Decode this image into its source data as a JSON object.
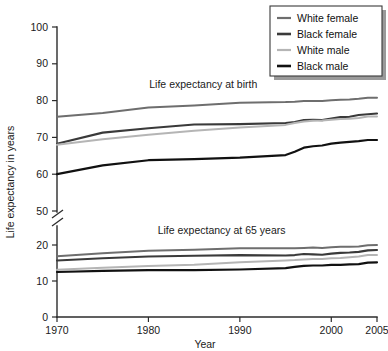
{
  "chart_data": {
    "type": "line",
    "title": "",
    "xlabel": "Year",
    "ylabel": "Life expectancy in years",
    "xlim": [
      1970,
      2005
    ],
    "ylim": [
      0,
      100
    ],
    "grid": false,
    "axis_break": {
      "present": true,
      "between": [
        20,
        50
      ],
      "note": "y-axis broken between 20 and 50"
    },
    "legend_position": "top-right",
    "x_ticks": [
      1970,
      1980,
      1990,
      2000,
      2005
    ],
    "x_tick_labels": [
      "1970",
      "1980",
      "1990",
      "2000",
      "2005"
    ],
    "y_ticks": [
      0,
      10,
      20,
      50,
      60,
      70,
      80,
      90,
      100
    ],
    "y_tick_labels": [
      "0",
      "10",
      "20",
      "50",
      "60",
      "70",
      "80",
      "90",
      "100"
    ],
    "annotations": [
      {
        "text": "Life expectancy at birth",
        "x": 1986,
        "y": 83.5
      },
      {
        "text": "Life expectancy at 65 years",
        "x": 1988,
        "y": 23.0
      }
    ],
    "legend_entries": [
      {
        "label": "White female",
        "color": "#6e6e6e"
      },
      {
        "label": "Black female",
        "color": "#3a3a3a"
      },
      {
        "label": "White male",
        "color": "#b5b5b5"
      },
      {
        "label": "Black male",
        "color": "#111111"
      }
    ],
    "x": [
      1970,
      1975,
      1980,
      1985,
      1990,
      1995,
      1996,
      1997,
      1998,
      1999,
      2000,
      2001,
      2002,
      2003,
      2004,
      2005
    ],
    "groups": [
      {
        "name": "Life expectancy at birth",
        "series": [
          {
            "name": "White female",
            "color": "#6e6e6e",
            "width": 2.0,
            "values": [
              75.6,
              76.6,
              78.1,
              78.7,
              79.4,
              79.6,
              79.7,
              79.9,
              79.9,
              79.9,
              80.1,
              80.2,
              80.3,
              80.5,
              80.8,
              80.8
            ]
          },
          {
            "name": "Black female",
            "color": "#3a3a3a",
            "width": 2.1,
            "values": [
              68.3,
              71.3,
              72.5,
              73.5,
              73.6,
              73.9,
              74.2,
              74.7,
              74.8,
              74.7,
              75.1,
              75.5,
              75.6,
              76.1,
              76.3,
              76.5
            ]
          },
          {
            "name": "White male",
            "color": "#b5b5b5",
            "width": 2.0,
            "values": [
              68.0,
              69.5,
              70.7,
              71.8,
              72.7,
              73.4,
              73.9,
              74.3,
              74.5,
              74.6,
              74.8,
              75.0,
              75.1,
              75.3,
              75.7,
              75.7
            ]
          },
          {
            "name": "Black male",
            "color": "#111111",
            "width": 2.2,
            "values": [
              60.0,
              62.4,
              63.8,
              64.1,
              64.5,
              65.2,
              66.1,
              67.2,
              67.6,
              67.8,
              68.3,
              68.6,
              68.8,
              69.0,
              69.3,
              69.3
            ]
          }
        ]
      },
      {
        "name": "Life expectancy at 65 years",
        "series": [
          {
            "name": "White female",
            "color": "#6e6e6e",
            "width": 2.0,
            "values": [
              16.9,
              17.7,
              18.4,
              18.7,
              19.1,
              19.1,
              19.1,
              19.2,
              19.3,
              19.2,
              19.4,
              19.5,
              19.5,
              19.6,
              19.9,
              20.0
            ]
          },
          {
            "name": "Black female",
            "color": "#3a3a3a",
            "width": 2.1,
            "values": [
              15.7,
              16.3,
              16.8,
              17.0,
              17.2,
              17.1,
              17.2,
              17.5,
              17.4,
              17.3,
              17.6,
              17.8,
              17.9,
              18.1,
              18.5,
              18.6
            ]
          },
          {
            "name": "White male",
            "color": "#b5b5b5",
            "width": 2.0,
            "values": [
              13.1,
              13.7,
              14.2,
              14.5,
              15.2,
              15.7,
              15.8,
              16.0,
              16.1,
              16.1,
              16.3,
              16.4,
              16.6,
              16.8,
              17.2,
              17.2
            ]
          },
          {
            "name": "Black male",
            "color": "#111111",
            "width": 2.2,
            "values": [
              12.5,
              12.8,
              13.0,
              13.0,
              13.2,
              13.6,
              13.9,
              14.2,
              14.3,
              14.3,
              14.5,
              14.5,
              14.6,
              14.7,
              15.1,
              15.2
            ]
          }
        ]
      }
    ]
  }
}
